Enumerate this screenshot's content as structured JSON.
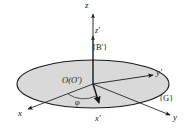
{
  "figure": {
    "type": "technical-diagram",
    "background_color": "#ffffff",
    "line_color": "#1a1a1a",
    "disk_fill_color": "#d9d9d9"
  },
  "labels": {
    "z_axis": "z",
    "z_prime_axis": "z'",
    "body_frame": "{B'}",
    "origin": "O(O')",
    "y_prime_axis": "y'",
    "ground_frame": "{G}",
    "y_axis": "y",
    "x_axis": "x",
    "x_prime_axis": "x'",
    "rotation_angle": "φ"
  },
  "geometry": {
    "disk_center_x": 93,
    "disk_center_y": 84,
    "disk_radius_x": 76,
    "disk_radius_y": 24,
    "z_axis_top_y": 12,
    "z_prime_arrow_y": 38,
    "axes": [
      {
        "name": "z",
        "from": [
          93,
          84
        ],
        "to": [
          93,
          12
        ]
      },
      {
        "name": "z'",
        "from": [
          93,
          84
        ],
        "to": [
          93,
          38
        ]
      },
      {
        "name": "x",
        "from": [
          93,
          84
        ],
        "to": [
          26,
          110
        ]
      },
      {
        "name": "y",
        "from": [
          93,
          84
        ],
        "to": [
          172,
          116
        ]
      },
      {
        "name": "x'",
        "from": [
          93,
          84
        ],
        "to": [
          99,
          105
        ]
      },
      {
        "name": "y'",
        "from": [
          93,
          84
        ],
        "to": [
          155,
          75
        ]
      }
    ]
  }
}
